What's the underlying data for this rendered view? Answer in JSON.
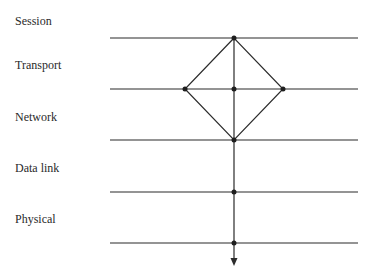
{
  "diagram": {
    "layers": [
      {
        "label": "Session",
        "label_y": 14,
        "line_y": 38
      },
      {
        "label": "Transport",
        "label_y": 58,
        "line_y": 89
      },
      {
        "label": "Network",
        "label_y": 110,
        "line_y": 140
      },
      {
        "label": "Data link",
        "label_y": 161,
        "line_y": 192
      },
      {
        "label": "Physical",
        "label_y": 212,
        "line_y": 243
      }
    ],
    "line_x_start": 110,
    "line_x_end": 358,
    "vertical_x": 234,
    "arrow_tip_y": 266,
    "diamond": {
      "top": [
        234,
        38
      ],
      "left": [
        185,
        89
      ],
      "right": [
        283,
        89
      ],
      "bottom": [
        234,
        140
      ],
      "center": [
        234,
        89
      ]
    },
    "colors": {
      "line": "#2b2b2b",
      "text": "#2a2a2a",
      "background": "#ffffff"
    }
  }
}
